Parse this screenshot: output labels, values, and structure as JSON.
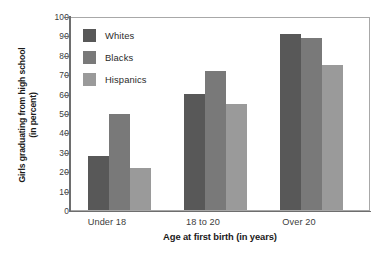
{
  "chart_data": {
    "type": "bar",
    "title": "",
    "xlabel": "Age at first birth (in years)",
    "ylabel": "Girls graduating from high school (in percent)",
    "ylabel_line1": "Girls graduating from high school",
    "ylabel_line2": "(in percent)",
    "categories": [
      "Under 18",
      "18 to 20",
      "Over 20"
    ],
    "ylim": [
      0,
      100
    ],
    "yticks": [
      0,
      10,
      20,
      30,
      40,
      50,
      60,
      70,
      80,
      90,
      100
    ],
    "ytick_labels": [
      "0",
      "10",
      "20",
      "30",
      "40",
      "50",
      "60",
      "70",
      "80",
      "90",
      "100"
    ],
    "grid": false,
    "legend_position": "upper left",
    "series": [
      {
        "name": "Whites",
        "color": "#585858",
        "values": [
          28,
          60,
          91
        ]
      },
      {
        "name": "Blacks",
        "color": "#797979",
        "values": [
          50,
          72,
          89
        ]
      },
      {
        "name": "Hispanics",
        "color": "#9a9a9a",
        "values": [
          22,
          55,
          75
        ]
      }
    ]
  },
  "legend": {
    "items": [
      {
        "label": "Whites"
      },
      {
        "label": "Blacks"
      },
      {
        "label": "Hispanics"
      }
    ]
  }
}
